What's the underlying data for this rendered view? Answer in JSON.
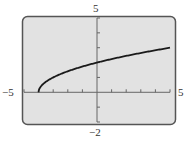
{
  "chart_data": {
    "type": "line",
    "title": "",
    "function": "y = sqrt(x + 4)",
    "xlabel": "",
    "ylabel": "",
    "xlim": [
      -5,
      5
    ],
    "ylim": [
      -2,
      5
    ],
    "x_tick_step": 1,
    "y_tick_step": 1,
    "grid": false,
    "tick_labels": {
      "xmin": "-5",
      "xmax": "5",
      "ymin": "-2",
      "ymax": "5"
    },
    "series": [
      {
        "name": "curve",
        "x": [
          -4,
          -3.75,
          -3,
          -2,
          -1,
          0,
          1,
          2,
          3,
          4,
          5
        ],
        "y": [
          0,
          0.5,
          1,
          1.414,
          1.732,
          2,
          2.236,
          2.449,
          2.646,
          2.828,
          3
        ]
      }
    ],
    "colors": {
      "screen_bg": "#e2e2e2",
      "frame": "#555555",
      "curve": "#1a1a1a",
      "axis": "#666666"
    }
  }
}
